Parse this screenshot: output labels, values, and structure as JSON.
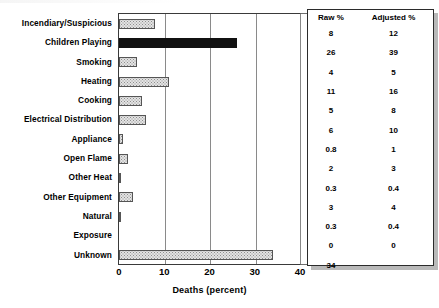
{
  "chart_data": {
    "type": "bar",
    "orientation": "horizontal",
    "title": "",
    "xlabel": "Deaths (percent)",
    "ylabel": "",
    "xlim": [
      0,
      40
    ],
    "xticks": [
      0,
      10,
      20,
      30,
      40
    ],
    "grid": true,
    "grid_axis": "x",
    "legend": "none",
    "categories": [
      "Incendiary/Suspicious",
      "Children Playing",
      "Smoking",
      "Heating",
      "Cooking",
      "Electrical Distribution",
      "Appliance",
      "Open Flame",
      "Other Heat",
      "Other Equipment",
      "Natural",
      "Exposure",
      "Unknown"
    ],
    "series": [
      {
        "name": "Raw %",
        "values": [
          8,
          26,
          4,
          11,
          5,
          6,
          0.8,
          2,
          0.3,
          3,
          0.3,
          0,
          34
        ]
      }
    ],
    "highlight_category": "Children Playing",
    "highlight_color": "#111111",
    "bar_color": "#e3e3e3",
    "bar_edge_color": "#555555"
  },
  "axis": {
    "xtick_labels": [
      "0",
      "10",
      "20",
      "30",
      "40"
    ],
    "xlabel": "Deaths (percent)"
  },
  "categories": [
    "Incendiary/Suspicious",
    "Children Playing",
    "Smoking",
    "Heating",
    "Cooking",
    "Electrical Distribution",
    "Appliance",
    "Open Flame",
    "Other Heat",
    "Other Equipment",
    "Natural",
    "Exposure",
    "Unknown"
  ],
  "table": {
    "headers": [
      "Raw %",
      "Adjusted %"
    ],
    "rows": [
      {
        "raw": "8",
        "adjusted": "12"
      },
      {
        "raw": "26",
        "adjusted": "39"
      },
      {
        "raw": "4",
        "adjusted": "5"
      },
      {
        "raw": "11",
        "adjusted": "16"
      },
      {
        "raw": "5",
        "adjusted": "8"
      },
      {
        "raw": "6",
        "adjusted": "10"
      },
      {
        "raw": "0.8",
        "adjusted": "1"
      },
      {
        "raw": "2",
        "adjusted": "3"
      },
      {
        "raw": "0.3",
        "adjusted": "0.4"
      },
      {
        "raw": "3",
        "adjusted": "4"
      },
      {
        "raw": "0.3",
        "adjusted": "0.4"
      },
      {
        "raw": "0",
        "adjusted": "0"
      },
      {
        "raw": "34",
        "adjusted": ""
      }
    ]
  }
}
